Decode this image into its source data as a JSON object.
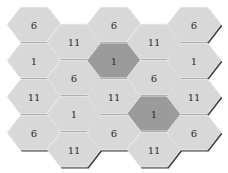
{
  "board": {
    "colors": {
      "light_fill": "#d8d8d8",
      "dark_fill": "#9b9b9b",
      "border": "#3a3a3a",
      "highlight": "#f2f2f2",
      "text": "#2b2b2b",
      "background": "#ffffff"
    },
    "hex": {
      "width": 54,
      "height": 35
    },
    "columns": [
      {
        "x": 7,
        "tops": [
          7,
          43,
          79,
          115
        ],
        "cells": [
          {
            "value": "6"
          },
          {
            "value": "1"
          },
          {
            "value": "11"
          },
          {
            "value": "6"
          }
        ]
      },
      {
        "x": 47,
        "tops": [
          24,
          60,
          96,
          132
        ],
        "cells": [
          {
            "value": "11"
          },
          {
            "value": "6"
          },
          {
            "value": "1"
          },
          {
            "value": "11"
          }
        ]
      },
      {
        "x": 87,
        "tops": [
          7,
          43,
          79,
          115
        ],
        "cells": [
          {
            "value": "6"
          },
          {
            "value": "1",
            "dark": true
          },
          {
            "value": "11"
          },
          {
            "value": "6"
          }
        ]
      },
      {
        "x": 127,
        "tops": [
          24,
          60,
          96,
          132
        ],
        "cells": [
          {
            "value": "11"
          },
          {
            "value": "6"
          },
          {
            "value": "1",
            "dark": true
          },
          {
            "value": "11"
          }
        ]
      },
      {
        "x": 167,
        "tops": [
          7,
          43,
          79,
          115
        ],
        "cells": [
          {
            "value": "6"
          },
          {
            "value": "1"
          },
          {
            "value": "11"
          },
          {
            "value": "6"
          }
        ]
      }
    ]
  }
}
